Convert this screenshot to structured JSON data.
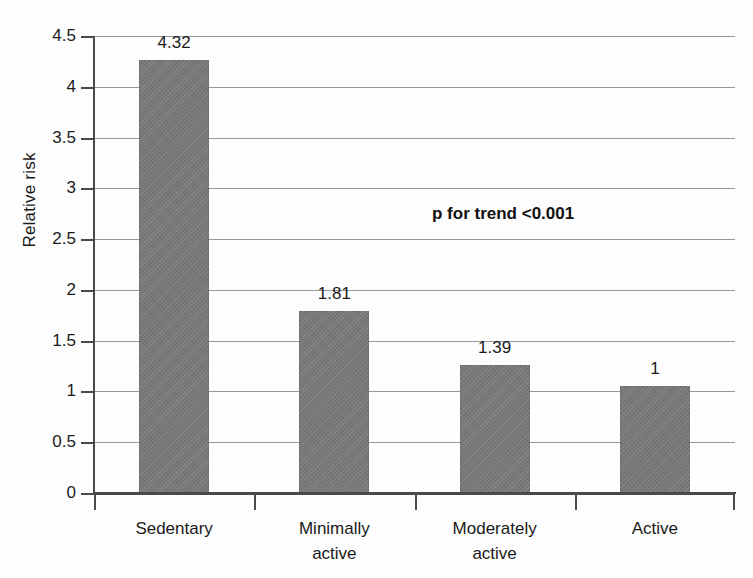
{
  "chart_data": {
    "type": "bar",
    "title": "",
    "xlabel": "",
    "ylabel": "Relative risk",
    "categories": [
      "Sedentary",
      "Minimally active",
      "Moderately active",
      "Active"
    ],
    "category_lines": [
      [
        "Sedentary"
      ],
      [
        "Minimally",
        "active"
      ],
      [
        "Moderately",
        "active"
      ],
      [
        "Active"
      ]
    ],
    "values": [
      4.32,
      1.81,
      1.39,
      1
    ],
    "value_labels": [
      "4.32",
      "1.81",
      "1.39",
      "1"
    ],
    "drawn_heights": [
      4.26,
      1.79,
      1.26,
      1.05
    ],
    "ylim": [
      0,
      4.5
    ],
    "ytick_values": [
      0,
      0.5,
      1,
      1.5,
      2,
      2.5,
      3,
      3.5,
      4,
      4.5
    ],
    "ytick_labels": [
      "0",
      "0.5",
      "1",
      "1.5",
      "2",
      "2.5",
      "3",
      "3.5",
      "4",
      "4.5"
    ],
    "grid": true,
    "legend": "none",
    "annotations": [
      {
        "text": "p for trend <0.001",
        "x": 432,
        "y": 204
      }
    ],
    "colors": {
      "bar_fill": "#777777",
      "grid": "#999999",
      "axis": "#4a4a4a",
      "text": "#1a1a1a",
      "background": "#fdfdfd"
    }
  },
  "figure": {
    "y_axis_title": "Relative risk",
    "annotation": "p for trend <0.001"
  }
}
